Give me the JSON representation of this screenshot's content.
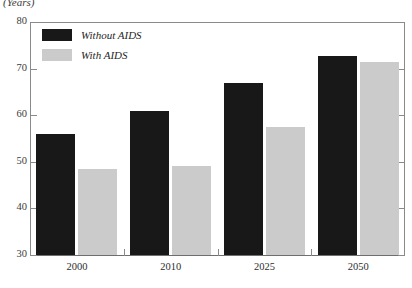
{
  "chart_data": {
    "type": "bar",
    "title": "",
    "xlabel": "",
    "ylabel": "(Years)",
    "ylim": [
      30,
      80
    ],
    "ytick_step": 10,
    "yticks": [
      80,
      70,
      60,
      50,
      40,
      30
    ],
    "ytick_labels": [
      "80",
      "70",
      "60",
      "50",
      "40",
      "30"
    ],
    "grid": false,
    "legend_position": "top-left",
    "categories": [
      "2000",
      "2010",
      "2025",
      "2050"
    ],
    "series": [
      {
        "name": "Without AIDS",
        "color": "#181818",
        "values": [
          56.0,
          61.0,
          67.0,
          72.6
        ]
      },
      {
        "name": "With AIDS",
        "color": "#cbcbcb",
        "values": [
          48.5,
          49.0,
          57.5,
          71.4
        ]
      }
    ]
  },
  "axis": {
    "unit_caption": "(Years)",
    "line_color": "#8a8a8a"
  },
  "legend": {
    "items": [
      {
        "label": "Without AIDS",
        "swatch": "dark"
      },
      {
        "label": "With AIDS",
        "swatch": "light"
      }
    ]
  }
}
